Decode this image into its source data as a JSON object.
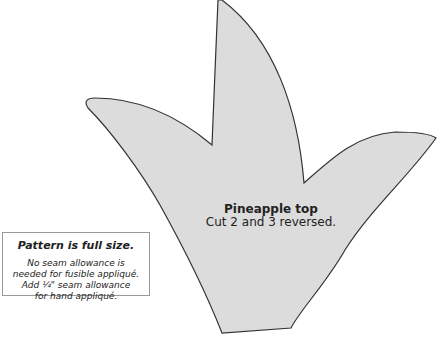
{
  "shape": {
    "name": "Pineapple top",
    "instruction": "Cut 2 and 3 reversed.",
    "fill": "#dcdcdc",
    "stroke": "#333333"
  },
  "note": {
    "heading": "Pattern is full size.",
    "lines": [
      "No seam allowance is",
      "needed for fusible appliqué.",
      "Add ¼\" seam allowance",
      "for hand appliqué."
    ]
  }
}
